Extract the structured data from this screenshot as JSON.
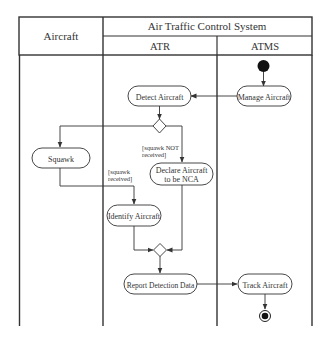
{
  "diagram": {
    "type": "uml-activity-swimlane",
    "header": {
      "group_title": "Air Traffic Control System",
      "lanes": [
        {
          "id": "aircraft",
          "label": "Aircraft"
        },
        {
          "id": "atr",
          "label": "ATR"
        },
        {
          "id": "atms",
          "label": "ATMS"
        }
      ]
    },
    "nodes": {
      "start": {
        "kind": "initial",
        "lane": "atms"
      },
      "manage_aircraft": {
        "kind": "action",
        "label": "Manage Aircraft",
        "lane": "atms"
      },
      "detect_aircraft": {
        "kind": "action",
        "label": "Detect Aircraft",
        "lane": "atr"
      },
      "decision": {
        "kind": "decision",
        "lane": "atr"
      },
      "squawk": {
        "kind": "action",
        "label": "Squawk",
        "lane": "aircraft"
      },
      "declare_nca": {
        "kind": "action",
        "label_line1": "Declare Aircraft",
        "label_line2": "to be NCA",
        "lane": "atr"
      },
      "identify_aircraft": {
        "kind": "action",
        "label": "Identify Aircraft",
        "lane": "atr"
      },
      "merge": {
        "kind": "merge",
        "lane": "atr"
      },
      "report_detection": {
        "kind": "action",
        "label": "Report Detection Data",
        "lane": "atr"
      },
      "track_aircraft": {
        "kind": "action",
        "label": "Track Aircraft",
        "lane": "atms"
      },
      "end": {
        "kind": "final",
        "lane": "atms"
      }
    },
    "guards": {
      "not_received_line1": "[squawk NOT",
      "not_received_line2": "received]",
      "received_line1": "[squawk",
      "received_line2": "received]"
    },
    "edges": [
      {
        "from": "start",
        "to": "manage_aircraft"
      },
      {
        "from": "manage_aircraft",
        "to": "detect_aircraft"
      },
      {
        "from": "detect_aircraft",
        "to": "decision"
      },
      {
        "from": "decision",
        "to": "squawk"
      },
      {
        "from": "decision",
        "to": "declare_nca",
        "guard": "[squawk NOT received]"
      },
      {
        "from": "squawk",
        "to": "identify_aircraft",
        "guard": "[squawk received]"
      },
      {
        "from": "identify_aircraft",
        "to": "merge"
      },
      {
        "from": "declare_nca",
        "to": "merge"
      },
      {
        "from": "merge",
        "to": "report_detection"
      },
      {
        "from": "report_detection",
        "to": "track_aircraft"
      },
      {
        "from": "track_aircraft",
        "to": "end"
      }
    ],
    "colors": {
      "line": "#333333",
      "fill": "#ffffff",
      "node_fill": "#111111"
    }
  }
}
